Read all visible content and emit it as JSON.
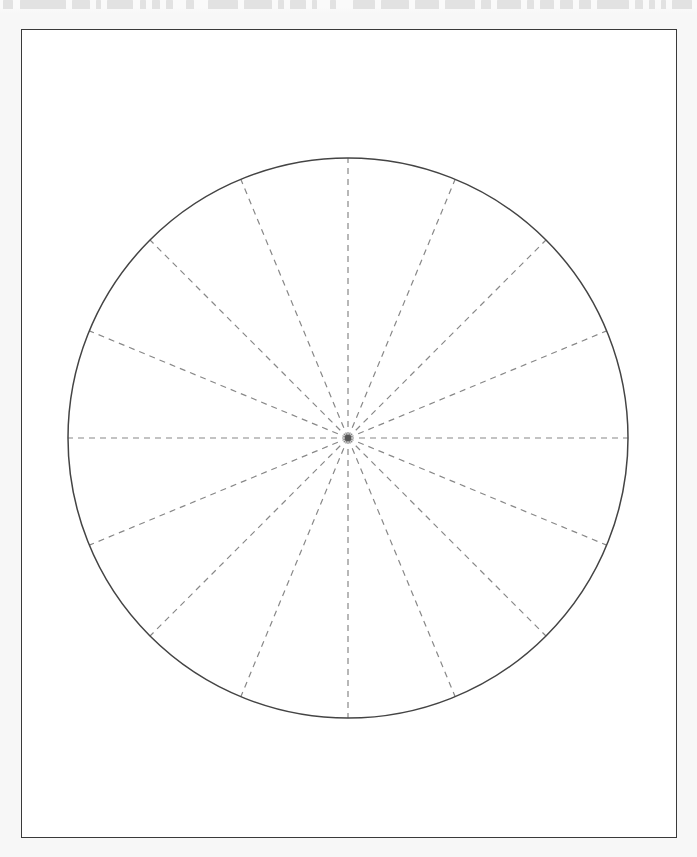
{
  "page": {
    "width": 697,
    "height": 857,
    "background_color": "#f7f7f7"
  },
  "top_sliver": {
    "description": "cut-off bottom edge of a line of text above the figure",
    "color": "#e2e2e2",
    "blocks": [
      {
        "x": 3,
        "w": 10
      },
      {
        "x": 20,
        "w": 46
      },
      {
        "x": 72,
        "w": 18
      },
      {
        "x": 96,
        "w": 5
      },
      {
        "x": 107,
        "w": 26
      },
      {
        "x": 140,
        "w": 6
      },
      {
        "x": 152,
        "w": 8
      },
      {
        "x": 166,
        "w": 7
      },
      {
        "x": 186,
        "w": 8
      },
      {
        "x": 208,
        "w": 30
      },
      {
        "x": 244,
        "w": 28
      },
      {
        "x": 278,
        "w": 6
      },
      {
        "x": 290,
        "w": 16
      },
      {
        "x": 312,
        "w": 5
      },
      {
        "x": 330,
        "w": 6
      },
      {
        "x": 353,
        "w": 22
      },
      {
        "x": 381,
        "w": 28
      },
      {
        "x": 415,
        "w": 24
      },
      {
        "x": 445,
        "w": 30
      },
      {
        "x": 481,
        "w": 10
      },
      {
        "x": 497,
        "w": 24
      },
      {
        "x": 527,
        "w": 7
      },
      {
        "x": 540,
        "w": 14
      },
      {
        "x": 560,
        "w": 13
      },
      {
        "x": 579,
        "w": 12
      },
      {
        "x": 597,
        "w": 32
      },
      {
        "x": 635,
        "w": 8
      },
      {
        "x": 649,
        "w": 6
      },
      {
        "x": 661,
        "w": 5
      },
      {
        "x": 672,
        "w": 20
      }
    ]
  },
  "frame": {
    "x": 21,
    "y": 29,
    "width": 656,
    "height": 809,
    "stroke_color": "#3a3a3a",
    "stroke_width": 1.4,
    "fill_color": "#ffffff"
  },
  "chart_data": {
    "type": "pie",
    "title": "",
    "subtitle": "",
    "xlabel": "",
    "ylabel": "",
    "grid": false,
    "legend": "none",
    "description": "Circle divided into 16 equal sectors by dashed radius lines drawn from the centre to the circumference",
    "circle": {
      "center_x": 348,
      "center_y": 438,
      "radius": 280,
      "stroke_color": "#444444",
      "stroke_width": 1.5,
      "fill": "none"
    },
    "center_dot": {
      "radius": 3.2,
      "color": "#555555"
    },
    "spokes": {
      "count": 16,
      "step_degrees": 22.5,
      "stroke_color": "#888888",
      "stroke_width": 1.2,
      "dash": "6 5",
      "angles_degrees": [
        0,
        22.5,
        45,
        67.5,
        90,
        112.5,
        135,
        157.5,
        180,
        202.5,
        225,
        247.5,
        270,
        292.5,
        315,
        337.5
      ]
    },
    "categories": [
      "1",
      "2",
      "3",
      "4",
      "5",
      "6",
      "7",
      "8",
      "9",
      "10",
      "11",
      "12",
      "13",
      "14",
      "15",
      "16"
    ],
    "values": [
      22.5,
      22.5,
      22.5,
      22.5,
      22.5,
      22.5,
      22.5,
      22.5,
      22.5,
      22.5,
      22.5,
      22.5,
      22.5,
      22.5,
      22.5,
      22.5
    ]
  }
}
